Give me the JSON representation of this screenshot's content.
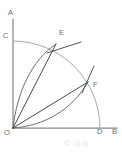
{
  "figure": {
    "type": "geometry-diagram",
    "background_color": "#ffffff",
    "stroke_colors": {
      "axis": "#8a8a8a",
      "arc": "#a9a9a9",
      "inner_curve": "#6f6f6f",
      "chord": "#4a4a4a",
      "tangent": "#555555",
      "label": "#6e6e6e",
      "watermark": "#e2e2e2"
    },
    "labels": {
      "a": "A",
      "b": "B",
      "c": "C",
      "d": "D",
      "e": "E",
      "f": "F",
      "o": "O"
    },
    "label_positions": {
      "a": {
        "x": 8,
        "y": 15
      },
      "b": {
        "x": 112,
        "y": 134
      },
      "c": {
        "x": 3,
        "y": 38
      },
      "d": {
        "x": 97,
        "y": 134
      },
      "e": {
        "x": 59,
        "y": 35
      },
      "f": {
        "x": 93,
        "y": 87
      },
      "o": {
        "x": 4,
        "y": 135
      }
    },
    "points": {
      "origin": {
        "x": 13,
        "y": 128
      },
      "axis_top": {
        "x": 13,
        "y": 19
      },
      "axis_right": {
        "x": 117,
        "y": 128
      },
      "c": {
        "x": 13,
        "y": 41
      },
      "d": {
        "x": 100,
        "y": 128
      },
      "e": {
        "x": 56,
        "y": 44
      },
      "f": {
        "x": 88,
        "y": 82
      }
    },
    "elements": [
      {
        "name": "vertical-axis",
        "from": "O",
        "to": "A"
      },
      {
        "name": "horizontal-axis",
        "from": "O",
        "to": "B"
      },
      {
        "name": "quarter-arc-cd",
        "from": "C",
        "to": "D"
      },
      {
        "name": "chord-oe",
        "from": "O",
        "to": "E"
      },
      {
        "name": "chord-of",
        "from": "O",
        "to": "F"
      },
      {
        "name": "curve-oe",
        "from": "O",
        "to": "E",
        "bulge": "left"
      },
      {
        "name": "curve-of",
        "from": "O",
        "to": "F",
        "bulge": "right"
      },
      {
        "name": "tangent-at-e",
        "at": "E"
      },
      {
        "name": "tangent-at-f",
        "at": "F"
      }
    ],
    "watermark": "© ⊙⊙"
  }
}
